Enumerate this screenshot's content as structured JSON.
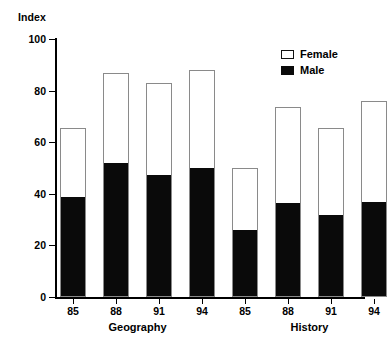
{
  "chart_data": {
    "type": "bar",
    "subtype": "stacked-bar",
    "title": "",
    "ylabel": "Index",
    "xlabel": "",
    "ylim": [
      0,
      100
    ],
    "yticks": [
      0,
      20,
      40,
      60,
      80,
      100
    ],
    "ytick_labels": [
      "0",
      "20",
      "40",
      "60",
      "80",
      "100"
    ],
    "grid": false,
    "legend_position": "top-right",
    "legend": [
      "Female",
      "Male"
    ],
    "groups": [
      {
        "name": "Geography",
        "categories": [
          "85",
          "88",
          "91",
          "94"
        ]
      },
      {
        "name": "History",
        "categories": [
          "85",
          "88",
          "91",
          "94"
        ]
      }
    ],
    "categories": [
      "85",
      "88",
      "91",
      "94",
      "85",
      "88",
      "91",
      "94"
    ],
    "series": [
      {
        "name": "Male",
        "color": "#0a0a0a",
        "values": [
          38.5,
          51.5,
          47.0,
          49.5,
          25.5,
          36.0,
          31.5,
          36.5
        ]
      },
      {
        "name": "Female",
        "color": "#ffffff",
        "values": [
          27.0,
          35.5,
          36.0,
          38.5,
          24.5,
          37.5,
          34.0,
          39.5
        ]
      }
    ],
    "totals": [
      65.5,
      87.0,
      83.0,
      88.0,
      50.0,
      73.5,
      65.5,
      76.0
    ]
  },
  "axis": {
    "y_title": "Index"
  },
  "legend": {
    "items": [
      {
        "label": "Female",
        "swatch": "white-square-icon"
      },
      {
        "label": "Male",
        "swatch": "black-square-icon"
      }
    ]
  }
}
